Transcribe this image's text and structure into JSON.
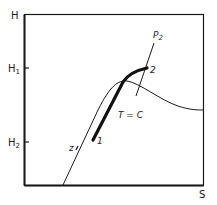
{
  "diagram": {
    "type": "thermodynamic H-S diagram",
    "axes": {
      "y_label": "H",
      "x_label": "S",
      "y_ticks": [
        {
          "label": "H",
          "sub": "1"
        },
        {
          "label": "H",
          "sub": "2"
        }
      ]
    },
    "curves": {
      "saturation_label": "z",
      "isobar_label_main": "P",
      "isobar_label_sub": "2",
      "isotherm_label": "T = C"
    },
    "points": {
      "start": "1",
      "end": "2"
    },
    "colors": {
      "line": "#1a1a1a",
      "background": "#ffffff"
    }
  }
}
